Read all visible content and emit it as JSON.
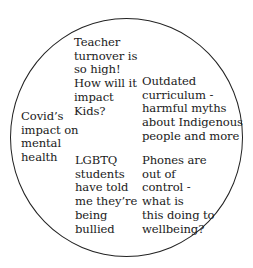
{
  "diagram": {
    "shape": "circle",
    "stroke_color": "#222222",
    "notes": [
      {
        "id": "teacher",
        "text": "Teacher\nturnover is\nso high!\nHow will it\nimpact\nKids?"
      },
      {
        "id": "curriculum",
        "text": "Outdated\ncurriculum -\nharmful myths\nabout Indigenous\npeople and more"
      },
      {
        "id": "covid",
        "text": "Covid’s\nimpact on\nmental\nhealth"
      },
      {
        "id": "lgbtq",
        "text": "LGBTQ\nstudents\nhave told\nme they’re\nbeing\nbullied"
      },
      {
        "id": "phones",
        "text": "Phones are\nout of\ncontrol -\nwhat is\nthis doing to\nwellbeing?"
      }
    ]
  }
}
